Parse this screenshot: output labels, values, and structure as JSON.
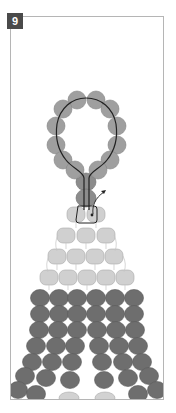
{
  "step": {
    "number": "9"
  },
  "colors": {
    "frame_border": "#b5b5b5",
    "badge_bg": "#4a4a4a",
    "badge_text": "#ffffff",
    "bead_loop": "#9a9a9a",
    "bead_light": "#cfcfcf",
    "bead_dark": "#6e6e6e",
    "thread": "#222222"
  },
  "diagram": {
    "loop_beads": 12,
    "stem_beads": 2,
    "light_rows": [
      2,
      3,
      4,
      5
    ],
    "dark_columns": 6
  }
}
